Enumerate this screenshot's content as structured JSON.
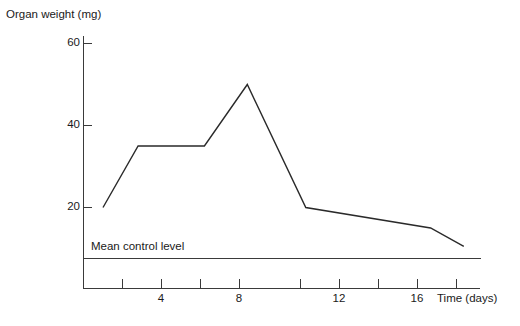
{
  "chart_data": {
    "type": "line",
    "title": "",
    "ylabel": "Organ weight (mg)",
    "xlabel": "Time (days)",
    "xlim": [
      0,
      22
    ],
    "ylim": [
      0,
      62
    ],
    "grid": false,
    "legend": "none",
    "y_ticks": [
      20,
      40,
      60
    ],
    "y_tick_labels": [
      "20",
      "40",
      "60"
    ],
    "x_ticks": [
      2,
      4,
      6,
      8,
      10,
      12,
      14,
      16,
      18
    ],
    "x_tick_labels": [
      "",
      "4",
      "",
      "8",
      "",
      "12",
      "",
      "16",
      ""
    ],
    "x_labeled_ticks": [
      4,
      8,
      12,
      16
    ],
    "series": [
      {
        "name": "Organ weight",
        "x": [
          1,
          2.8,
          6.2,
          8.4,
          11.4,
          17.8,
          19.5
        ],
        "y": [
          20,
          35,
          35,
          50,
          20,
          15,
          10.5
        ]
      }
    ],
    "annotations": [
      {
        "name": "mean-control-level",
        "label": "Mean control level",
        "type": "hline",
        "y": 7.5,
        "x_start": 0,
        "x_end": 20.4
      }
    ]
  },
  "axes": {
    "y_axis_title": "Organ weight (mg)",
    "x_axis_title": "Time (days)"
  },
  "tick_labels": {
    "y": [
      "60",
      "40",
      "20"
    ],
    "x": [
      "4",
      "8",
      "12",
      "16"
    ]
  },
  "annotation": {
    "mean_control_level": "Mean control level"
  },
  "colors": {
    "line": "#2a2a2a",
    "axis": "#3a3a3a",
    "text": "#1a1a1a",
    "background": "#ffffff"
  }
}
